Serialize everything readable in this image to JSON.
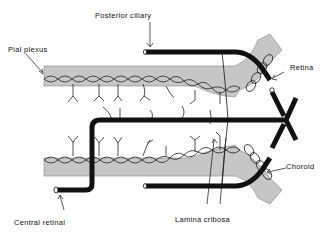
{
  "diagram": {
    "type": "anatomical schematic",
    "labels": {
      "posterior_ciliary": "Posterior ciliary",
      "pial_plexus": "Pial plexus",
      "retina": "Retina",
      "choroid": "Choroid",
      "central_retinal": "Central retinal",
      "lamina_cribosa": "Lamina cribosa"
    },
    "colors": {
      "vessel": "#111111",
      "tissue": "#c4c4c4",
      "background": "#ffffff"
    }
  }
}
